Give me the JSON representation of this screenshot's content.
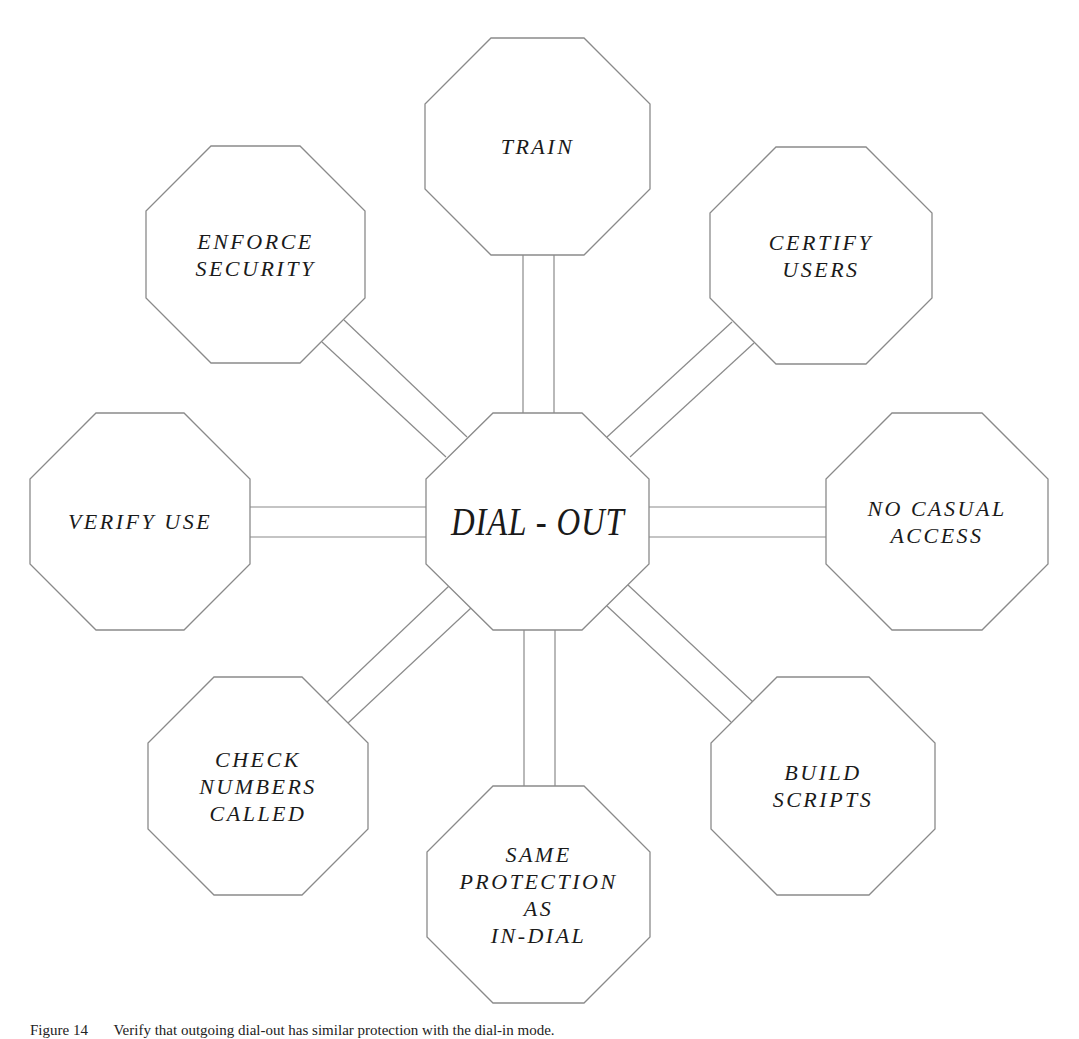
{
  "diagram": {
    "center": {
      "label": "DIAL - OUT"
    },
    "nodes": [
      {
        "id": "train",
        "lines": [
          "TRAIN"
        ]
      },
      {
        "id": "certify-users",
        "lines": [
          "CERTIFY",
          "USERS"
        ]
      },
      {
        "id": "no-casual-access",
        "lines": [
          "NO CASUAL",
          "ACCESS"
        ]
      },
      {
        "id": "build-scripts",
        "lines": [
          "BUILD",
          "SCRIPTS"
        ]
      },
      {
        "id": "same-protection",
        "lines": [
          "SAME",
          "PROTECTION",
          "AS",
          "IN-DIAL"
        ]
      },
      {
        "id": "check-numbers-called",
        "lines": [
          "CHECK",
          "NUMBERS",
          "CALLED"
        ]
      },
      {
        "id": "verify-use",
        "lines": [
          "VERIFY USE"
        ]
      },
      {
        "id": "enforce-security",
        "lines": [
          "ENFORCE",
          "SECURITY"
        ]
      }
    ],
    "colors": {
      "stroke": "#8a8a8a",
      "text": "#1a1a1a",
      "background": "#ffffff"
    }
  },
  "caption": {
    "figure_number": "Figure 14",
    "text": "Verify that outgoing dial-out has similar protection with the dial-in mode."
  }
}
